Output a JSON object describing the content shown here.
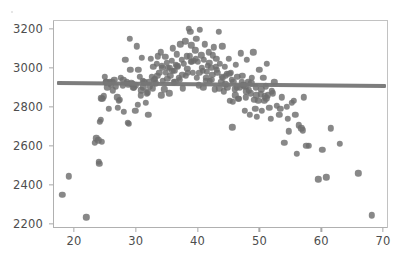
{
  "figure": {
    "background_color": "#ffffff",
    "width": 403,
    "height": 259
  },
  "axes": {
    "frame_color": "#b0b0b0",
    "left_px": 53,
    "top_px": 20,
    "width_px": 335,
    "height_px": 208
  },
  "chart_data": {
    "type": "scatter",
    "title": "",
    "xlabel": "",
    "ylabel": "",
    "xlim": [
      16.6,
      70.8
    ],
    "ylim": [
      2180,
      3245
    ],
    "xticks": [
      20,
      30,
      40,
      50,
      60,
      70
    ],
    "yticks": [
      2200,
      2400,
      2600,
      2800,
      3000,
      3200
    ],
    "grid": false,
    "legend": null,
    "marker_color": "#6e6e6e",
    "marker_size_px": 6.4,
    "marker_opacity": 0.82,
    "series": [
      {
        "name": "observations",
        "x": [
          18.1,
          19.2,
          22.0,
          23.4,
          23.6,
          23.9,
          24.0,
          24.1,
          24.2,
          24.3,
          24.4,
          24.6,
          24.8,
          25.0,
          25.2,
          25.4,
          25.6,
          25.8,
          26.0,
          26.2,
          26.5,
          26.8,
          27.0,
          27.2,
          27.4,
          27.6,
          27.9,
          28.1,
          28.3,
          28.5,
          28.7,
          28.9,
          29.0,
          29.1,
          29.3,
          29.5,
          29.7,
          29.9,
          30.0,
          30.2,
          30.4,
          30.6,
          30.8,
          31.0,
          31.2,
          31.4,
          31.6,
          31.8,
          32.0,
          32.2,
          32.4,
          32.6,
          32.8,
          33.0,
          33.2,
          33.4,
          33.6,
          33.8,
          34.0,
          34.2,
          34.4,
          34.6,
          34.8,
          35.0,
          35.2,
          35.4,
          35.6,
          35.8,
          36.0,
          36.2,
          36.4,
          36.6,
          36.8,
          37.0,
          37.2,
          37.4,
          37.6,
          37.8,
          38.0,
          38.2,
          38.4,
          38.6,
          38.8,
          39.0,
          39.2,
          39.4,
          39.6,
          39.8,
          40.0,
          40.2,
          40.4,
          40.6,
          40.8,
          41.0,
          41.2,
          41.4,
          41.6,
          41.8,
          42.0,
          42.2,
          42.4,
          42.6,
          42.8,
          43.0,
          43.2,
          43.4,
          43.6,
          43.8,
          44.0,
          44.2,
          44.4,
          44.6,
          44.8,
          45.0,
          45.2,
          45.4,
          45.6,
          45.8,
          46.0,
          46.2,
          46.4,
          46.6,
          46.8,
          47.0,
          47.2,
          47.4,
          47.6,
          47.8,
          48.0,
          48.2,
          48.4,
          48.6,
          48.8,
          49.0,
          49.2,
          49.4,
          49.6,
          49.8,
          50.0,
          50.2,
          50.4,
          50.6,
          50.8,
          51.0,
          51.2,
          51.4,
          51.6,
          51.8,
          52.0,
          52.4,
          52.8,
          53.2,
          53.6,
          54.0,
          54.4,
          54.8,
          55.2,
          55.6,
          56.0,
          56.4,
          56.8,
          57.2,
          57.6,
          58.0,
          59.5,
          60.2,
          60.8,
          61.5,
          63.0,
          66.0,
          68.2,
          24.5,
          25.1,
          26.3,
          27.1,
          28.0,
          28.8,
          29.6,
          30.3,
          31.1,
          31.9,
          32.7,
          33.5,
          34.3,
          35.1,
          35.9,
          36.7,
          37.5,
          38.3,
          39.1,
          39.9,
          40.7,
          41.5,
          42.3,
          43.1,
          43.9,
          44.7,
          45.5,
          46.3,
          47.1,
          47.9,
          48.7,
          49.5,
          50.3,
          51.1,
          52.2,
          53.4,
          54.6,
          55.8,
          57.0,
          33.1,
          34.9,
          36.5,
          38.1,
          39.7,
          41.3,
          42.9,
          44.5,
          46.1,
          47.7,
          49.3,
          35.5,
          37.1,
          38.7,
          40.3,
          41.9,
          43.5,
          45.1,
          46.7,
          48.3,
          34.1,
          36.1,
          38.9,
          40.9,
          42.5,
          44.1,
          45.7,
          30.9,
          32.3,
          50.9
        ],
        "y": [
          2350,
          2445,
          2235,
          2615,
          2640,
          2630,
          2520,
          2510,
          2725,
          2735,
          2845,
          2840,
          2855,
          2955,
          2930,
          2900,
          2790,
          2925,
          2915,
          2930,
          2940,
          2905,
          2850,
          2830,
          2835,
          2950,
          2910,
          2775,
          3040,
          2925,
          2720,
          2715,
          3150,
          2990,
          2920,
          2915,
          2900,
          2780,
          2910,
          3110,
          2990,
          2955,
          2860,
          3050,
          2900,
          2925,
          2820,
          2870,
          2760,
          2930,
          3045,
          2955,
          3005,
          2940,
          2920,
          3020,
          3060,
          2975,
          3080,
          3010,
          2935,
          2890,
          3055,
          3025,
          3000,
          2870,
          2960,
          3035,
          3100,
          2985,
          2930,
          3070,
          3005,
          2950,
          3120,
          3040,
          2895,
          3020,
          3135,
          3060,
          2975,
          3200,
          3185,
          3115,
          2975,
          3035,
          3090,
          3150,
          3030,
          2910,
          3195,
          3065,
          2985,
          3040,
          3120,
          2950,
          3010,
          3080,
          2935,
          3000,
          2965,
          3105,
          2890,
          3045,
          2975,
          3185,
          3020,
          2930,
          3110,
          2880,
          3005,
          2960,
          2900,
          3045,
          2830,
          2975,
          2695,
          2930,
          2890,
          3015,
          2955,
          2840,
          2900,
          3075,
          2960,
          2910,
          2780,
          2850,
          3040,
          2925,
          2760,
          2870,
          2950,
          3080,
          2835,
          2900,
          2750,
          2830,
          2990,
          2865,
          2780,
          2950,
          2830,
          2905,
          3020,
          2860,
          2795,
          2740,
          2880,
          2925,
          2805,
          2760,
          2850,
          2615,
          2800,
          2675,
          2820,
          2830,
          2560,
          2705,
          2690,
          2850,
          2600,
          2600,
          2430,
          2580,
          2440,
          2690,
          2610,
          2460,
          2245,
          2620,
          2925,
          2885,
          2795,
          2940,
          2915,
          2900,
          2810,
          2935,
          2875,
          2895,
          2960,
          3000,
          2945,
          2985,
          3010,
          2965,
          2995,
          3030,
          2950,
          3000,
          2980,
          2940,
          2990,
          2955,
          2970,
          2940,
          2900,
          2930,
          2880,
          2920,
          2860,
          2890,
          2845,
          2870,
          2790,
          2740,
          2760,
          2680,
          2945,
          2975,
          3015,
          2960,
          3045,
          2935,
          3005,
          2915,
          2860,
          2905,
          2790,
          3000,
          2940,
          3060,
          2975,
          3025,
          2895,
          2970,
          2840,
          2885,
          2860,
          2925,
          3030,
          2900,
          3065,
          2950,
          2825,
          2885,
          2905,
          2855
        ],
        "color": "#6e6e6e"
      }
    ],
    "trendline": {
      "type": "linear-fit",
      "x_start": 17.2,
      "x_end": 70.4,
      "y_start": 2921,
      "y_end": 2906,
      "color": "#767676",
      "width_px": 4.2
    }
  }
}
